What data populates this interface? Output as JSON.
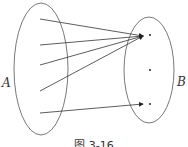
{
  "diagram": {
    "set_a_label": "A",
    "set_b_label": "B",
    "caption": "图 3-16",
    "mapping": {
      "domain_points": 5,
      "codomain_points": 3,
      "arrows": [
        {
          "from": 1,
          "to": 1
        },
        {
          "from": 2,
          "to": 1
        },
        {
          "from": 3,
          "to": 1
        },
        {
          "from": 4,
          "to": 1
        },
        {
          "from": 5,
          "to": 3
        }
      ]
    },
    "colors": {
      "stroke": "#444444",
      "background": "#ffffff"
    }
  }
}
